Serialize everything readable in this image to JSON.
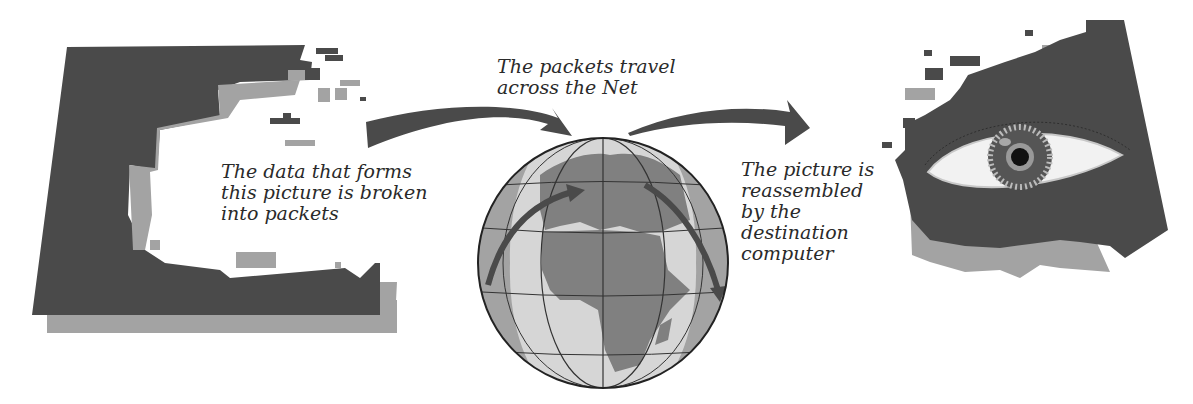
{
  "diagram": {
    "steps": [
      {
        "id": "source",
        "caption": "The data that forms\nthis picture is broken\ninto packets"
      },
      {
        "id": "transit",
        "caption": "The packets travel\nacross the Net"
      },
      {
        "id": "destination",
        "caption": "The picture is\nreassembled\nby the\ndestination\ncomputer"
      }
    ],
    "icons": {
      "source": "fragmented-picture-icon",
      "transit": "globe-icon",
      "destination": "eye-picture-icon",
      "arrows": [
        "curved-arrow-right-icon",
        "curved-arrow-right-icon"
      ]
    },
    "colors": {
      "dark": "#4a4a4a",
      "mid": "#a3a3a3",
      "light": "#d6d6d6",
      "white": "#ffffff",
      "text": "#2a2a2a"
    }
  }
}
